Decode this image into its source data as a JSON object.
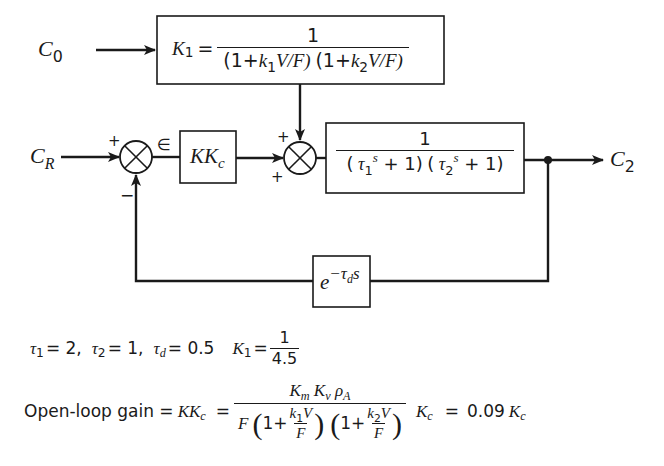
{
  "diagram": {
    "type": "feedback-control-block-diagram",
    "inputs": {
      "disturbance": "C",
      "disturbance_sub": "0",
      "setpoint": "C",
      "setpoint_sub": "R"
    },
    "output": {
      "label": "C",
      "sub": "2"
    },
    "error_symbol": "∈",
    "blocks": {
      "disturbance_gain": {
        "lhs": "K",
        "lhs_sub": "1",
        "eq": "=",
        "numerator": "1",
        "den_part1_open": "(1+",
        "den_k1": "k",
        "den_k1_sub": "1",
        "den_part1_rest": "V/F)",
        "den_part2_open": "(1+",
        "den_k2": "k",
        "den_k2_sub": "2",
        "den_part2_rest": "V/F)"
      },
      "controller": {
        "main": "KK",
        "sub": "c"
      },
      "process": {
        "numerator": "1",
        "den_a_open": "(",
        "den_tau1": "τ",
        "den_tau1_sub": "1",
        "den_s1": "s",
        "den_a_rest": " + 1)",
        "den_b_open": "(",
        "den_tau2": "τ",
        "den_tau2_sub": "2",
        "den_s2": "s",
        "den_b_rest": " + 1)"
      },
      "dead_time": {
        "base": "e",
        "exp_minus": "−τ",
        "exp_sub": "d",
        "exp_s": "s"
      }
    },
    "summing_junctions": [
      {
        "id": "comparator",
        "signs": {
          "top_left": "+",
          "bottom": "−"
        }
      },
      {
        "id": "disturbance_sum",
        "signs": {
          "top": "+",
          "bottom_left": "+"
        }
      }
    ]
  },
  "parameters": {
    "tau1": {
      "sym": "τ",
      "sub": "1",
      "val": "= 2,"
    },
    "tau2": {
      "sym": "τ",
      "sub": "2",
      "val": "= 1,"
    },
    "taud": {
      "sym": "τ",
      "sub": "d",
      "val": "= 0.5"
    },
    "K1": {
      "sym": "K",
      "sub": "1",
      "eq": "=",
      "num": "1",
      "den": "4.5"
    }
  },
  "open_loop_gain": {
    "label": "Open-loop gain = ",
    "lhs": "KK",
    "lhs_sub": "c",
    "eq": "=",
    "numerator": {
      "Km": "K",
      "Km_sub": "m",
      "Kv": "K",
      "Kv_sub": "v",
      "rho": "ρ",
      "rho_sub": "A"
    },
    "denominator": {
      "F": "F",
      "paren1_one": "1+",
      "paren1_num": "k",
      "paren1_num_sub": "1",
      "paren1_num_V": "V",
      "paren1_den": "F",
      "paren2_one": "1+",
      "paren2_num": "k",
      "paren2_num_sub": "2",
      "paren2_num_V": "V",
      "paren2_den": "F"
    },
    "times": "K",
    "times_sub": "c",
    "result_eq": "=",
    "result_coef": "0.09",
    "result_K": "K",
    "result_K_sub": "c"
  }
}
